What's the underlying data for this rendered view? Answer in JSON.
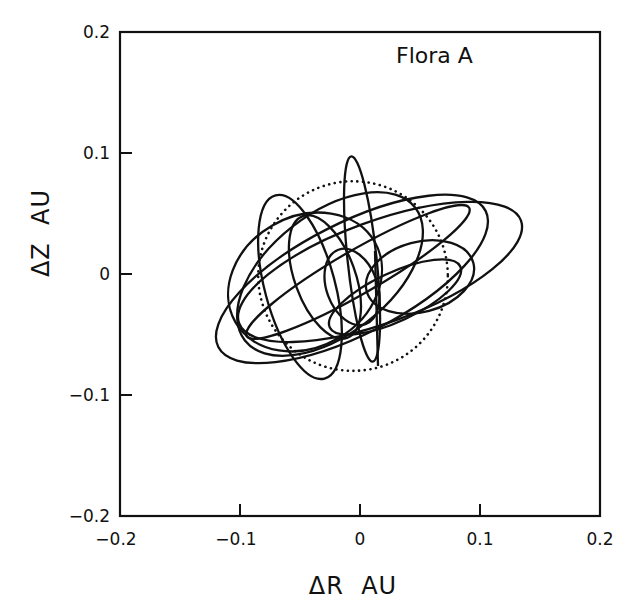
{
  "chart_data": {
    "type": "line",
    "title": "Flora A",
    "xlabel": "ΔR  AU",
    "ylabel": "ΔZ  AU",
    "xlim": [
      -0.2,
      0.2
    ],
    "ylim": [
      -0.2,
      0.2
    ],
    "xticks": [
      -0.2,
      -0.1,
      0,
      0.1,
      0.2
    ],
    "yticks": [
      -0.2,
      -0.1,
      0,
      0.1,
      0.2
    ],
    "xtick_labels": [
      "-0.2",
      "-0.1",
      "0",
      "0.1",
      "0.2"
    ],
    "ytick_labels": [
      "-0.2",
      "-0.1",
      "0",
      "0.1",
      "0.2"
    ],
    "grid": false,
    "legend": null,
    "annotation": "Flora A (upper right inside plot)",
    "reference_circle": {
      "style": "dotted",
      "cx": -0.0058,
      "cy": -0.0017,
      "r": 0.079
    },
    "series": [
      {
        "name": "loop-1",
        "style": "solid",
        "cx": -0.0067,
        "cy": -0.0041,
        "a": 0.125,
        "b": 0.046,
        "rot_deg": -27
      },
      {
        "name": "loop-2",
        "style": "solid",
        "cx": 0.0167,
        "cy": 0.0017,
        "a": 0.125,
        "b": 0.042,
        "rot_deg": -20
      },
      {
        "name": "loop-3",
        "style": "solid",
        "cx": -0.0458,
        "cy": -0.0066,
        "a": 0.067,
        "b": 0.054,
        "rot_deg": -30
      },
      {
        "name": "loop-4",
        "style": "solid",
        "cx": -0.05,
        "cy": -0.0107,
        "a": 0.079,
        "b": 0.029,
        "rot_deg": 75
      },
      {
        "name": "loop-5",
        "style": "solid",
        "cx": -0.0292,
        "cy": -0.0025,
        "a": 0.054,
        "b": 0.025,
        "rot_deg": 70
      },
      {
        "name": "loop-6",
        "style": "solid",
        "cx": 0.0017,
        "cy": 0.0124,
        "a": 0.086,
        "b": 0.012,
        "rot_deg": 84
      },
      {
        "name": "loop-7",
        "style": "solid",
        "cx": 0.05,
        "cy": -0.0025,
        "a": 0.046,
        "b": 0.029,
        "rot_deg": -15
      },
      {
        "name": "loop-8",
        "style": "solid",
        "cx": -0.0067,
        "cy": -0.0107,
        "a": 0.033,
        "b": 0.021,
        "rot_deg": 70
      },
      {
        "name": "loop-9",
        "style": "solid",
        "cx": -0.0017,
        "cy": 0.0017,
        "a": 0.107,
        "b": 0.018,
        "rot_deg": -30
      },
      {
        "name": "loop-10",
        "style": "solid",
        "cx": 0.0292,
        "cy": -0.019,
        "a": 0.06,
        "b": 0.02,
        "rot_deg": -25
      },
      {
        "name": "loop-11",
        "style": "solid",
        "cx": -0.025,
        "cy": 0.0,
        "a": 0.09,
        "b": 0.05,
        "rot_deg": -38
      }
    ],
    "segments": [
      {
        "name": "vertical-trace",
        "style": "solid",
        "x": [
          0.0125,
          0.015
        ],
        "y": [
          0.019,
          -0.076
        ]
      }
    ]
  }
}
